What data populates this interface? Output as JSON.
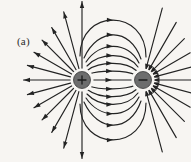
{
  "figure": {
    "panel_label": "(a)",
    "background_color": "#f7f5f2",
    "line_color": "#232323",
    "charge_fill_color": "#6d6d6d"
  },
  "chart_data": {
    "type": "scatter",
    "subtitle": "(a)",
    "xlabel": "",
    "ylabel": "",
    "xlim": [
      0,
      191
    ],
    "ylim": [
      162,
      0
    ],
    "grid": false,
    "legend": null,
    "annotations": [
      "(a)"
    ],
    "charges": [
      {
        "name": "positive-charge",
        "sign": "+",
        "label": "+",
        "x": 82,
        "y": 80,
        "radius": 8.5,
        "halo_radius": 11.5,
        "fill": "#6d6d6d"
      },
      {
        "name": "negative-charge",
        "sign": "-",
        "label": "−",
        "x": 143,
        "y": 80,
        "radius": 8.5,
        "halo_radius": 11.5,
        "fill": "#6d6d6d"
      }
    ],
    "dipole_axis_y": 80,
    "dipole_separation": 61,
    "field_line_arcs": [
      {
        "name": "arc-upper-1",
        "path": "M 89,74 C 100,70 125,70 136,75",
        "arrow_at": 0.5,
        "arrow_dir": 0
      },
      {
        "name": "arc-upper-2",
        "path": "M 88,70 C 100,61 126,61 137,71",
        "arrow_at": 0.5,
        "arrow_dir": 0
      },
      {
        "name": "arc-upper-3",
        "path": "M 87,66 C 100,52 127,52 138,67",
        "arrow_at": 0.5,
        "arrow_dir": 0
      },
      {
        "name": "arc-upper-4",
        "path": "M 86,62 C 100,41 128,41 139,63",
        "arrow_at": 0.5,
        "arrow_dir": 0
      },
      {
        "name": "arc-upper-5",
        "path": "M 84,58 C 98,27 130,27 141,59",
        "arrow_at": 0.5,
        "arrow_dir": 0
      },
      {
        "name": "arc-upper-6",
        "path": "M 80,56 C 80,8 146,8 146,57",
        "arrow_at": 0.5,
        "arrow_dir": 0
      },
      {
        "name": "arc-lower-1",
        "path": "M 89,86 C 100,90 125,90 136,85",
        "arrow_at": 0.5,
        "arrow_dir": 0
      },
      {
        "name": "arc-lower-2",
        "path": "M 88,90 C 100,99 126,99 137,89",
        "arrow_at": 0.5,
        "arrow_dir": 0
      },
      {
        "name": "arc-lower-3",
        "path": "M 87,94 C 100,108 127,108 138,93",
        "arrow_at": 0.5,
        "arrow_dir": 0
      },
      {
        "name": "arc-lower-4",
        "path": "M 86,98 C 100,119 128,119 139,97",
        "arrow_at": 0.5,
        "arrow_dir": 0
      },
      {
        "name": "arc-lower-5",
        "path": "M 84,102 C 98,133 130,133 141,101",
        "arrow_at": 0.5,
        "arrow_dir": 0
      },
      {
        "name": "arc-lower-6",
        "path": "M 80,104 C 80,152 146,152 146,103",
        "arrow_at": 0.5,
        "arrow_dir": 0
      }
    ],
    "positive_radial_lines": [
      {
        "name": "radial-pos-left",
        "angle_deg": 180,
        "length": 50,
        "has_arrow": true
      },
      {
        "name": "radial-pos-up-15",
        "angle_deg": 195,
        "length": 48,
        "has_arrow": true
      },
      {
        "name": "radial-pos-up-30",
        "angle_deg": 210,
        "length": 47,
        "has_arrow": true
      },
      {
        "name": "radial-pos-up-45",
        "angle_deg": 225,
        "length": 48,
        "has_arrow": true
      },
      {
        "name": "radial-pos-up-60",
        "angle_deg": 240,
        "length": 52,
        "has_arrow": true
      },
      {
        "name": "radial-pos-up-75",
        "angle_deg": 255,
        "length": 62,
        "has_arrow": true
      },
      {
        "name": "radial-pos-up-90",
        "angle_deg": 270,
        "length": 70,
        "has_arrow": true
      },
      {
        "name": "radial-pos-dn-15",
        "angle_deg": 165,
        "length": 48,
        "has_arrow": true
      },
      {
        "name": "radial-pos-dn-30",
        "angle_deg": 150,
        "length": 47,
        "has_arrow": true
      },
      {
        "name": "radial-pos-dn-45",
        "angle_deg": 135,
        "length": 48,
        "has_arrow": true
      },
      {
        "name": "radial-pos-dn-60",
        "angle_deg": 120,
        "length": 52,
        "has_arrow": true
      },
      {
        "name": "radial-pos-dn-75",
        "angle_deg": 105,
        "length": 62,
        "has_arrow": true
      },
      {
        "name": "radial-pos-dn-90",
        "angle_deg": 90,
        "length": 70,
        "has_arrow": true
      }
    ],
    "negative_radial_lines": [
      {
        "name": "radial-neg-right",
        "angle_deg": 0,
        "length": 44,
        "has_arrow": true
      },
      {
        "name": "radial-neg-up-15",
        "angle_deg": 345,
        "length": 44,
        "has_arrow": true
      },
      {
        "name": "radial-neg-up-30",
        "angle_deg": 330,
        "length": 46,
        "has_arrow": true
      },
      {
        "name": "radial-neg-up-45",
        "angle_deg": 315,
        "length": 50,
        "has_arrow": true
      },
      {
        "name": "radial-neg-up-60",
        "angle_deg": 300,
        "length": 58,
        "has_arrow": true
      },
      {
        "name": "radial-neg-up-75",
        "angle_deg": 285,
        "length": 66,
        "has_arrow": true
      },
      {
        "name": "radial-neg-dn-15",
        "angle_deg": 15,
        "length": 44,
        "has_arrow": true
      },
      {
        "name": "radial-neg-dn-30",
        "angle_deg": 30,
        "length": 46,
        "has_arrow": true
      },
      {
        "name": "radial-neg-dn-45",
        "angle_deg": 45,
        "length": 50,
        "has_arrow": true
      },
      {
        "name": "radial-neg-dn-60",
        "angle_deg": 60,
        "length": 58,
        "has_arrow": true
      },
      {
        "name": "radial-neg-dn-75",
        "angle_deg": 75,
        "length": 66,
        "has_arrow": true
      }
    ],
    "axis_line": {
      "name": "dipole-axis-segment",
      "x1": 91,
      "y1": 80,
      "x2": 134,
      "y2": 80
    },
    "midline_arrow_x": 112,
    "arrow_head_length": 6.5,
    "arrow_head_width": 4.4
  }
}
